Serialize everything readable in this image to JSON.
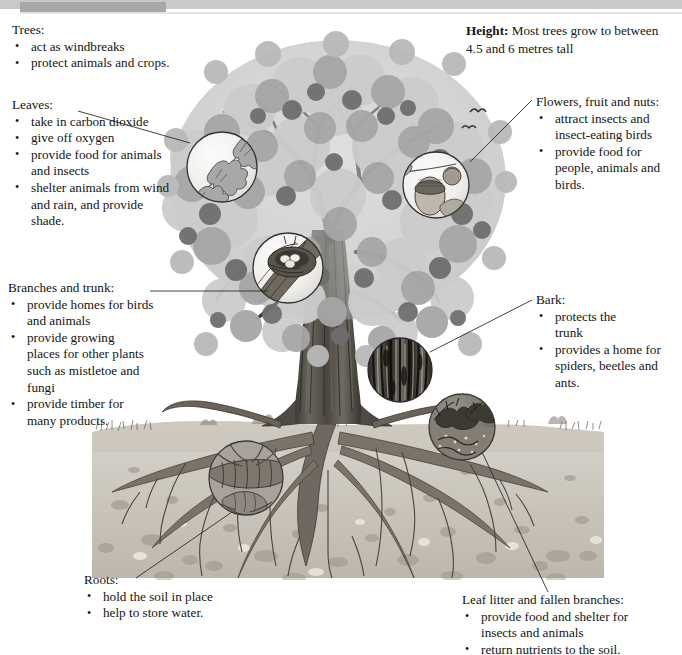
{
  "page": {
    "header_bar": {
      "light_color": "#c9c9c9",
      "dark_color": "#a8a8a8"
    },
    "illustration": {
      "subject": "oak-tree-cross-section",
      "style": "greyscale pencil illustration",
      "ground_line_y": 425,
      "colors": {
        "canopy_light": "#d0d0d0",
        "canopy_mid": "#a5a5a5",
        "canopy_dark": "#6f6f6f",
        "trunk": "#4a4a4a",
        "soil": "#cfcbc4",
        "soil_stone": "#a9a49c",
        "root": "#6b6459",
        "line": "#2b2b2b"
      }
    }
  },
  "callouts": {
    "trees": {
      "heading": "Trees:",
      "items": [
        "act as windbreaks",
        "protect animals and crops."
      ]
    },
    "height": {
      "label": "Height:",
      "text": " Most trees grow to between 4.5 and 6 metres tall"
    },
    "leaves": {
      "heading": "Leaves:",
      "items": [
        "take in carbon dioxide",
        "give off oxygen",
        "provide food for animals and insects",
        "shelter animals from wind and rain, and provide shade."
      ]
    },
    "branches": {
      "heading": "Branches and trunk:",
      "items": [
        "provide homes for birds and animals",
        "provide growing places for other plants such as mistletoe and fungi",
        "provide timber for many products."
      ]
    },
    "roots": {
      "heading": "Roots:",
      "items": [
        "hold the soil in place",
        "help to store water."
      ]
    },
    "flowers": {
      "heading": "Flowers, fruit and nuts:",
      "items": [
        "attract insects and insect-eating birds",
        "provide food for people, animals and birds."
      ]
    },
    "bark": {
      "heading": "Bark:",
      "items": [
        "protects the trunk",
        "provides a home for spiders, beetles and ants."
      ]
    },
    "litter": {
      "heading": "Leaf litter and fallen branches:",
      "items": [
        "provide food and shelter for insects and animals",
        "return nutrients to the soil."
      ]
    }
  },
  "magnifiers": [
    {
      "name": "leaf-detail",
      "cx": 222,
      "cy": 167,
      "r": 36,
      "depicts": "oak leaves on twig"
    },
    {
      "name": "acorn-detail",
      "cx": 436,
      "cy": 185,
      "r": 34,
      "depicts": "acorn, flower and leaf"
    },
    {
      "name": "nest-detail",
      "cx": 288,
      "cy": 268,
      "r": 36,
      "depicts": "bird nest with eggs on branch"
    },
    {
      "name": "bark-detail",
      "cx": 400,
      "cy": 370,
      "r": 33,
      "depicts": "dark furrowed bark texture"
    },
    {
      "name": "leaf-litter-detail",
      "cx": 462,
      "cy": 427,
      "r": 34,
      "depicts": "fallen leaves and insects"
    },
    {
      "name": "root-detail",
      "cx": 246,
      "cy": 478,
      "r": 38,
      "depicts": "root cross-section with grub"
    }
  ]
}
